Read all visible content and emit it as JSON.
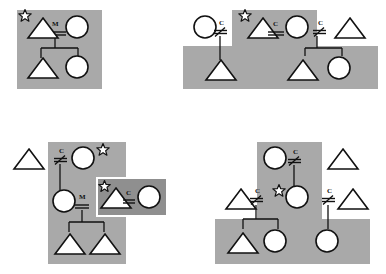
{
  "figure": {
    "title": "",
    "symbol_legend": {
      "triangle": "male-individual",
      "circle": "female-individual",
      "star": "starred-individual",
      "double-line": "union-line",
      "slashed-double-line": "severed-union-line",
      "vertical-line": "descent-line",
      "gray-rectangle": "co-residence-group",
      "dark-rectangle": "inset-co-residence-group"
    },
    "relationship_labels": {
      "marriage": "M",
      "consanguineal": "C"
    }
  },
  "panels": [
    {
      "id": "panel-top-left",
      "name": "Panel A",
      "regions": [
        {
          "name": "group-1",
          "x": 17,
          "y": 10,
          "w": 85,
          "h": 79,
          "shade": "light"
        }
      ],
      "individuals": [
        {
          "id": "a1",
          "sex": "male",
          "shape": "triangle",
          "x": 30,
          "y": 17,
          "star": true
        },
        {
          "id": "a2",
          "sex": "female",
          "shape": "circle",
          "x": 68,
          "y": 16,
          "star": false
        },
        {
          "id": "a3",
          "sex": "male",
          "shape": "triangle",
          "x": 30,
          "y": 56,
          "star": false
        },
        {
          "id": "a4",
          "sex": "female",
          "shape": "circle",
          "x": 68,
          "y": 55,
          "star": false
        }
      ],
      "links": [
        {
          "type": "union",
          "label": "M",
          "slashed": false,
          "x": 52,
          "y": 27
        },
        {
          "type": "descent",
          "from": "a1-a2",
          "to": [
            "a3",
            "a4"
          ]
        }
      ]
    },
    {
      "id": "panel-top-right",
      "name": "Panel B",
      "regions": [
        {
          "name": "group-2-upper",
          "x": 232,
          "y": 10,
          "w": 85,
          "h": 38,
          "shade": "light"
        },
        {
          "name": "group-2-lower",
          "x": 183,
          "y": 46,
          "w": 195,
          "h": 43,
          "shade": "light"
        }
      ],
      "individuals": [
        {
          "id": "b1",
          "sex": "female",
          "shape": "circle",
          "x": 196,
          "y": 16,
          "star": false
        },
        {
          "id": "b2",
          "sex": "male",
          "shape": "triangle",
          "x": 250,
          "y": 17,
          "star": true
        },
        {
          "id": "b3",
          "sex": "female",
          "shape": "circle",
          "x": 288,
          "y": 16,
          "star": false
        },
        {
          "id": "b4",
          "sex": "male",
          "shape": "triangle",
          "x": 337,
          "y": 17,
          "star": false
        },
        {
          "id": "b5",
          "sex": "male",
          "shape": "triangle",
          "x": 208,
          "y": 58,
          "star": false
        },
        {
          "id": "b6",
          "sex": "male",
          "shape": "triangle",
          "x": 290,
          "y": 58,
          "star": false
        },
        {
          "id": "b7",
          "sex": "female",
          "shape": "circle",
          "x": 330,
          "y": 57,
          "star": false
        }
      ],
      "links": [
        {
          "type": "union",
          "label": "C",
          "slashed": true,
          "x": 222,
          "y": 26
        },
        {
          "type": "union",
          "label": "C",
          "slashed": false,
          "x": 272,
          "y": 27
        },
        {
          "type": "union",
          "label": "C",
          "slashed": true,
          "x": 321,
          "y": 26
        }
      ]
    },
    {
      "id": "panel-bottom-left",
      "name": "Panel C",
      "regions": [
        {
          "name": "group-3",
          "x": 48,
          "y": 142,
          "w": 78,
          "h": 122,
          "shade": "light"
        },
        {
          "name": "group-3-inset",
          "x": 96,
          "y": 177,
          "w": 72,
          "h": 40,
          "shade": "dark"
        }
      ],
      "individuals": [
        {
          "id": "c0",
          "sex": "male",
          "shape": "triangle",
          "x": 16,
          "y": 146,
          "star": false
        },
        {
          "id": "c1",
          "sex": "female",
          "shape": "circle",
          "x": 74,
          "y": 147,
          "star": true
        },
        {
          "id": "c2",
          "sex": "female",
          "shape": "circle",
          "x": 55,
          "y": 190,
          "star": false
        },
        {
          "id": "c3",
          "sex": "male",
          "shape": "triangle",
          "x": 101,
          "y": 185,
          "star": true
        },
        {
          "id": "c4",
          "sex": "female",
          "shape": "circle",
          "x": 138,
          "y": 185,
          "star": false
        },
        {
          "id": "c5",
          "sex": "male",
          "shape": "triangle",
          "x": 57,
          "y": 232,
          "star": false
        },
        {
          "id": "c6",
          "sex": "male",
          "shape": "triangle",
          "x": 85,
          "y": 232,
          "star": false
        }
      ],
      "links": [
        {
          "type": "union",
          "label": "C",
          "slashed": true,
          "x": 62,
          "y": 154
        },
        {
          "type": "union",
          "label": "M",
          "slashed": false,
          "x": 79,
          "y": 196
        },
        {
          "type": "union",
          "label": "C",
          "slashed": false,
          "x": 126,
          "y": 194
        },
        {
          "type": "descent",
          "from": "c2-union",
          "to": [
            "c5",
            "c6"
          ]
        }
      ]
    },
    {
      "id": "panel-bottom-right",
      "name": "Panel D",
      "regions": [
        {
          "name": "group-4-upper",
          "x": 257,
          "y": 142,
          "w": 65,
          "h": 80,
          "shade": "light"
        },
        {
          "name": "group-4-lower",
          "x": 215,
          "y": 219,
          "w": 155,
          "h": 45,
          "shade": "light"
        }
      ],
      "individuals": [
        {
          "id": "d1",
          "sex": "female",
          "shape": "circle",
          "x": 266,
          "y": 147,
          "star": false
        },
        {
          "id": "d2",
          "sex": "male",
          "shape": "triangle",
          "x": 330,
          "y": 146,
          "star": false
        },
        {
          "id": "d3",
          "sex": "male",
          "shape": "triangle",
          "x": 228,
          "y": 186,
          "star": false
        },
        {
          "id": "d4",
          "sex": "female",
          "shape": "circle",
          "x": 288,
          "y": 185,
          "star": true
        },
        {
          "id": "d5",
          "sex": "male",
          "shape": "triangle",
          "x": 340,
          "y": 186,
          "star": false
        },
        {
          "id": "d6",
          "sex": "male",
          "shape": "triangle",
          "x": 230,
          "y": 230,
          "star": false
        },
        {
          "id": "d7",
          "sex": "female",
          "shape": "circle",
          "x": 266,
          "y": 229,
          "star": false
        },
        {
          "id": "d8",
          "sex": "female",
          "shape": "circle",
          "x": 318,
          "y": 229,
          "star": false
        }
      ],
      "links": [
        {
          "type": "union",
          "label": "C",
          "slashed": true,
          "x": 295,
          "y": 155
        },
        {
          "type": "union",
          "label": "C",
          "slashed": true,
          "x": 257,
          "y": 194
        },
        {
          "type": "union",
          "label": "C",
          "slashed": true,
          "x": 329,
          "y": 194
        }
      ]
    }
  ],
  "colors": {
    "region_light": "#a9a9a9",
    "region_dark": "#8f8f8f",
    "stroke": "#111111",
    "symbol_fill": "#ffffff",
    "page_background": "#ffffff"
  }
}
